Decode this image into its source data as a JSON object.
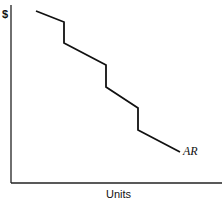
{
  "chart_data": {
    "type": "line",
    "title": "",
    "xlabel": "Units",
    "ylabel": "$",
    "grid": false,
    "legend": null,
    "series": [
      {
        "name": "AR",
        "description": "Stepped (kinked) average revenue / demand curve",
        "points_px": [
          [
            36,
            11
          ],
          [
            64,
            22
          ],
          [
            64,
            43
          ],
          [
            106,
            65
          ],
          [
            106,
            87
          ],
          [
            138,
            108
          ],
          [
            138,
            130
          ],
          [
            180,
            152
          ]
        ]
      }
    ],
    "annotations": [
      {
        "text": "AR",
        "at": "end of curve"
      }
    ],
    "axis_ticks": "none"
  },
  "labels": {
    "y_axis": "$",
    "x_axis": "Units",
    "curve": "AR"
  }
}
